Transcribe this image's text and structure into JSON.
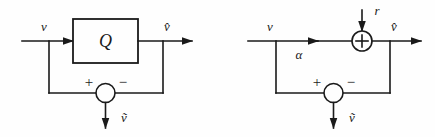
{
  "figure": {
    "type": "block-diagram-pair",
    "background_color": "#fefefe",
    "line_color": "#1a1a1a",
    "width": 435,
    "height": 137
  },
  "left_diagram": {
    "name": "quantizer-error-block-diagram",
    "input_label": "v",
    "block_label": "Q",
    "output_label": "v̂",
    "error_output_label": "ṽ",
    "summing_plus": "+",
    "summing_minus": "−"
  },
  "right_diagram": {
    "name": "additive-noise-model-block-diagram",
    "input_label": "v",
    "injection_label": "r",
    "branch_label": "α",
    "adder_symbol": "+",
    "output_label": "v̂",
    "error_output_label": "ṽ",
    "summing_plus": "+",
    "summing_minus": "−"
  }
}
